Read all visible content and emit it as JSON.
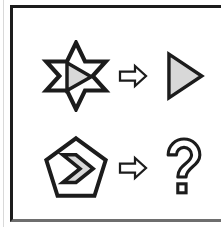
{
  "panel": {
    "name": "visual-analogy-puzzle-panel",
    "background_color": "#ffffff",
    "border_color": "#1c1c1c",
    "outline_color": "#1c1c1c",
    "fill_color": "#d8d8d8"
  },
  "rows": [
    {
      "id": "row-example",
      "source": {
        "icon": "six-pointed-star-with-inner-triangle-icon",
        "label": "six-pointed star containing right-pointing triangle"
      },
      "operator": {
        "icon": "rightwards-white-arrow-icon",
        "label": "⇨"
      },
      "result": {
        "icon": "right-pointing-triangle-icon",
        "label": "right-pointing triangle"
      }
    },
    {
      "id": "row-question",
      "source": {
        "icon": "pentagon-with-inner-chevron-icon",
        "label": "pentagon containing right chevron"
      },
      "operator": {
        "icon": "rightwards-white-arrow-icon",
        "label": "⇨"
      },
      "result": {
        "icon": "question-mark-outline-icon",
        "label": "?"
      }
    }
  ]
}
